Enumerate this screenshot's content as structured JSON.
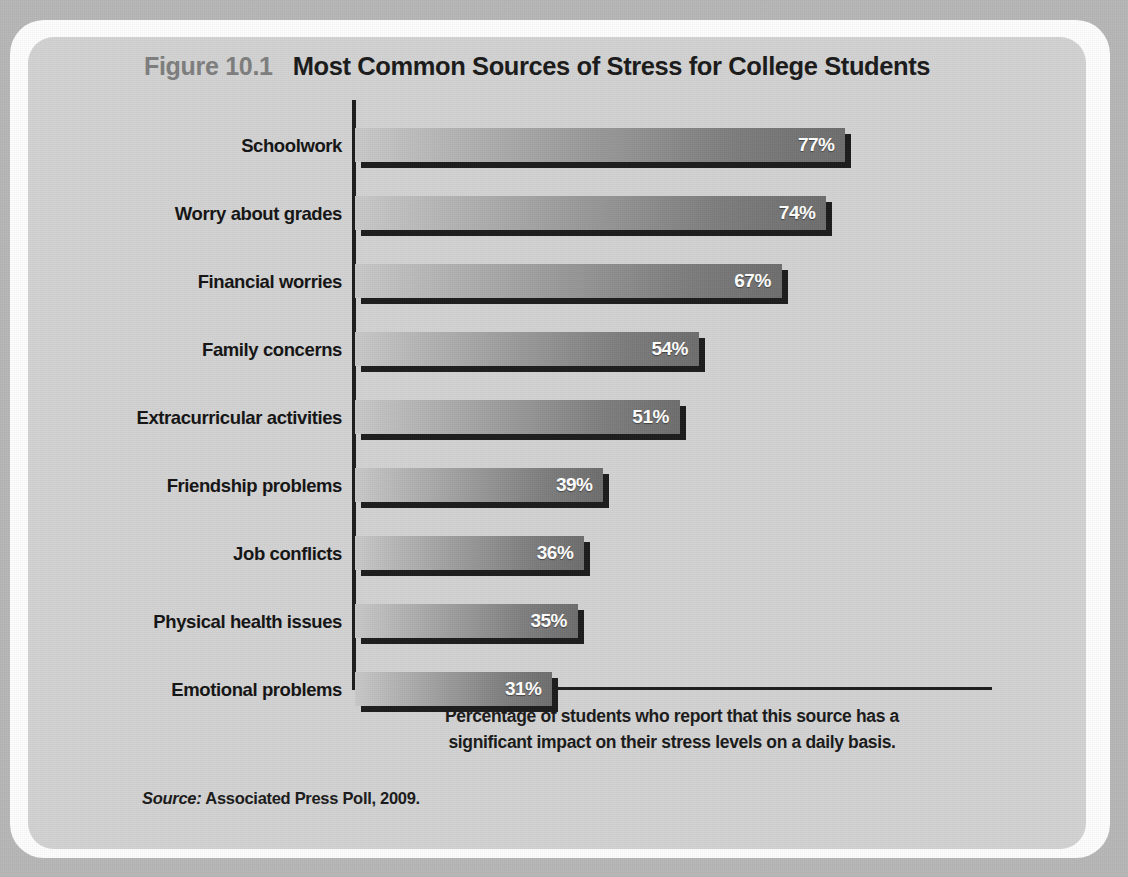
{
  "figure": {
    "number": "Figure 10.1",
    "title": "Most Common Sources of Stress for College Students",
    "caption_line1": "Percentage of students who report that this source has a",
    "caption_line2": "significant impact on their stress levels on a daily basis.",
    "source_label": "Source:",
    "source_text": "Associated Press Poll, 2009."
  },
  "colors": {
    "page_background": "#b7b7b7",
    "panel_background": "#d2d2d2",
    "rim": "#fdfdfd",
    "axis": "#1d1d1d",
    "figure_number": "#7e7e7e",
    "title": "#1a1a1a",
    "bar_gradient_start": "#c9c9c9",
    "bar_gradient_end": "#6e6e6e",
    "bar_shadow": "#1c1c1c",
    "value_label": "#ffffff"
  },
  "chart_data": {
    "type": "bar",
    "orientation": "horizontal",
    "title": "Most Common Sources of Stress for College Students",
    "xlabel": "",
    "ylabel": "",
    "xlim": [
      0,
      100
    ],
    "grid": false,
    "legend": "none",
    "value_suffix": "%",
    "categories": [
      "Schoolwork",
      "Worry about grades",
      "Financial worries",
      "Family concerns",
      "Extracurricular activities",
      "Friendship problems",
      "Job conflicts",
      "Physical health issues",
      "Emotional problems"
    ],
    "values": [
      77,
      74,
      67,
      54,
      51,
      39,
      36,
      35,
      31
    ],
    "value_labels": [
      "77%",
      "74%",
      "67%",
      "54%",
      "51%",
      "39%",
      "36%",
      "35%",
      "31%"
    ]
  }
}
